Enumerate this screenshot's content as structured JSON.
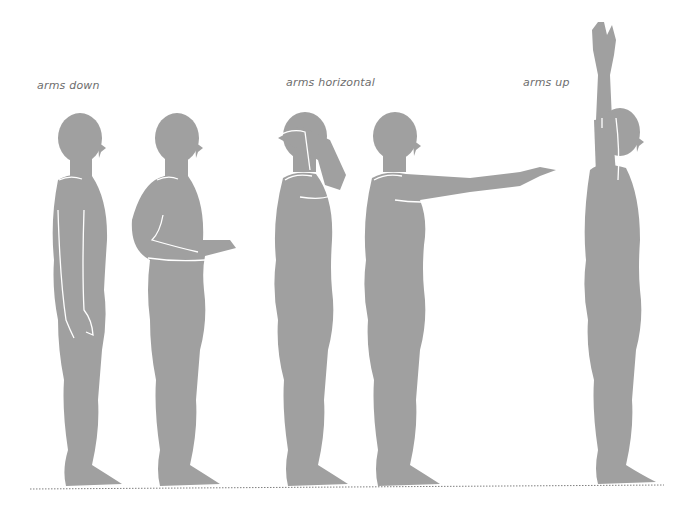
{
  "labels": {
    "arms_down": "arms down",
    "arms_horizontal": "arms horizontal",
    "arms_up": "arms up"
  },
  "figures": [
    {
      "id": "figure-1",
      "group": "arms down",
      "pose": "arms at sides"
    },
    {
      "id": "figure-2",
      "group": "arms down",
      "pose": "forearm forward, elbow bent"
    },
    {
      "id": "figure-3",
      "group": "arms horizontal",
      "pose": "hand on head"
    },
    {
      "id": "figure-4",
      "group": "arms horizontal",
      "pose": "arm extended forward"
    },
    {
      "id": "figure-5",
      "group": "arms up",
      "pose": "arm raised overhead"
    }
  ],
  "colors": {
    "figure_fill": "#a0a0a0",
    "outline": "#ffffff",
    "ground_line": "#808080",
    "label_text": "#6e6e6e"
  }
}
